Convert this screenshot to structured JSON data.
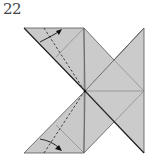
{
  "diagram": {
    "step_number": "22",
    "colors": {
      "paper": "#c8c8c8",
      "edge": "#555555",
      "crease": "#7a7a7a",
      "valley_fold": "#333333",
      "arrow": "#111111",
      "background": "#ffffff"
    },
    "elements": [
      {
        "type": "paper-model",
        "description": "Flattened origami base with two left flaps and a right pinwheel-like shape"
      },
      {
        "type": "valley-fold-line",
        "position": "upper-left flap",
        "style": "dashed"
      },
      {
        "type": "fold-arrow",
        "position": "upper-left flap",
        "direction": "fold up and right"
      },
      {
        "type": "valley-fold-line",
        "position": "lower-left flap",
        "style": "dashed"
      },
      {
        "type": "fold-arrow",
        "position": "lower-left flap",
        "direction": "fold down and right"
      }
    ]
  }
}
